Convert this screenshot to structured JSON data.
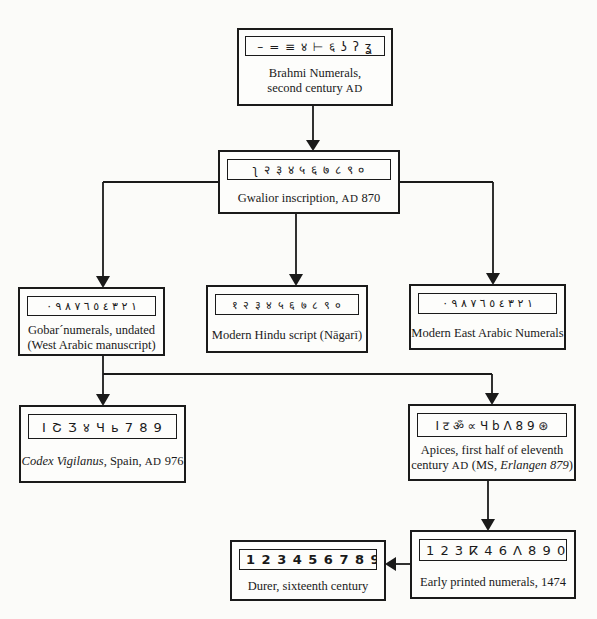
{
  "diagram": {
    "type": "flowchart",
    "nodes": [
      {
        "id": "brahmi",
        "glyphs": "– = ≡ ४ ⊢ ६ ʖ ʔ ʓ",
        "caption_line1": "Brahmi  Numerals,",
        "caption_line2_pre": "second century ",
        "caption_line2_era": "AD"
      },
      {
        "id": "gwalior",
        "glyphs": "ʅ २ ३ ४ ५ ६ ७ ८ ९ ०",
        "caption_pre": "Gwalior inscription, ",
        "caption_era": "AD",
        "caption_post": " 870"
      },
      {
        "id": "gobar",
        "glyphs": "١ ٢ ٣ ٤ ٥ ٦ ٧ ٨ ٩ ٠",
        "caption_line1": "Gobar´numerals, undated",
        "caption_line2": "(West Arabic manuscript)"
      },
      {
        "id": "nagari",
        "glyphs": "१ २ ३ ४ ५ ६ ७ ८ ९ ०",
        "caption": "Modern Hindu script (Nāgarī)"
      },
      {
        "id": "east_arabic",
        "glyphs": "١ ٢ ٣ ٤ ٥ ٦ ٧ ٨ ٩ ٠",
        "caption": "Modern East Arabic Numerals"
      },
      {
        "id": "codex",
        "glyphs": "I Շ Ʒ ४ Ч ь 7 8 9",
        "caption_italic": "Codex Vigilanus",
        "caption_pre": ", Spain, ",
        "caption_era": "AD",
        "caption_post": " 976"
      },
      {
        "id": "apices",
        "glyphs": "I ट ॐ ∝ Ч b Λ 8 9 ⊛",
        "caption_line1": "Apices, first half of eleventh",
        "caption_line2_pre": "century ",
        "caption_line2_era": "AD",
        "caption_line2_mid": " (MS, ",
        "caption_line2_italic": "Erlangen 879",
        "caption_line2_post": ")"
      },
      {
        "id": "early_printed",
        "glyphs": "1 2 3 ⴽ 4 6 Λ 8 9 0",
        "caption": "Early printed numerals, 1474"
      },
      {
        "id": "durer",
        "glyphs": "1 2 3 4 5  6 7 8 9 0",
        "caption": "Durer, sixteenth century"
      }
    ],
    "edges": [
      {
        "from": "brahmi",
        "to": "gwalior"
      },
      {
        "from": "gwalior",
        "to": "gobar"
      },
      {
        "from": "gwalior",
        "to": "nagari"
      },
      {
        "from": "gwalior",
        "to": "east_arabic"
      },
      {
        "from": "gobar",
        "to": "codex"
      },
      {
        "from": "gobar",
        "to": "apices"
      },
      {
        "from": "apices",
        "to": "early_printed"
      },
      {
        "from": "early_printed",
        "to": "durer"
      }
    ]
  },
  "colors": {
    "ink": "#1a1a1a",
    "paper": "#fbfbf9"
  }
}
